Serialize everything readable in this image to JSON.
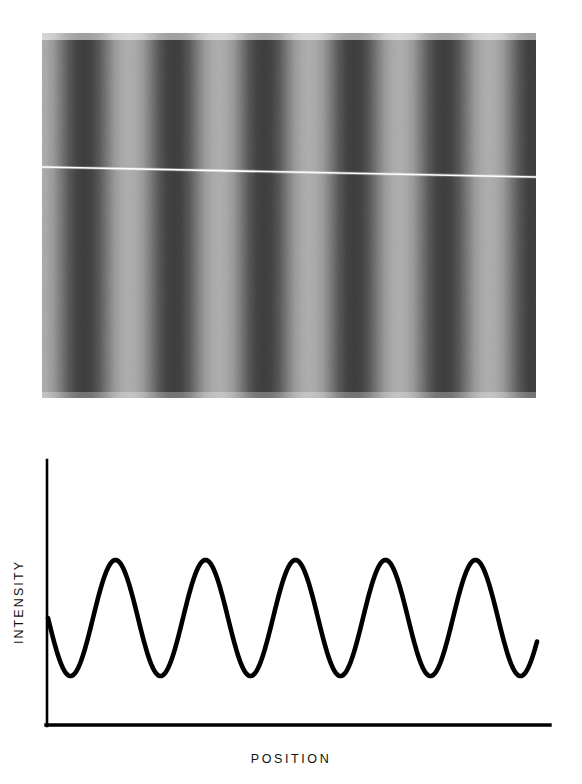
{
  "figure": {
    "kind": "interference-fringe-figure",
    "background_color": "#ffffff",
    "ink_color": "#000000"
  },
  "fringe_photograph": {
    "name": "interference-fringe-photograph",
    "description": "Grayscale photograph of vertical sinusoidal interference fringes",
    "bounds": {
      "x": 42,
      "y": 33,
      "width": 494,
      "height": 365
    },
    "fringe_period_px": 90,
    "fringe_count": 5.5,
    "first_dark_band_center_px": 90,
    "orientation": "vertical-bands",
    "bright_color": "#d9d9d9",
    "dark_color": "#090909",
    "grain_opacity": 0.2,
    "scratch": {
      "name": "horizontal-scratch-line",
      "color": "#ffffff",
      "y_left": 167,
      "y_right": 177,
      "thickness": 1.6
    }
  },
  "chart_data": {
    "type": "line",
    "title": "",
    "subtitle": "",
    "xlabel": "POSITION",
    "ylabel": "INTENSITY",
    "x_tick_labels": [],
    "y_tick_labels": [],
    "grid": false,
    "legend": null,
    "annotations": [],
    "series": [
      {
        "name": "intensity-profile",
        "waveform": "sinusoid",
        "color": "#000000",
        "stroke_width": 4.6,
        "cycles": 5.5,
        "period_px": 90,
        "amplitude_px": 58,
        "midline_px": 618,
        "peak_y_px": 560,
        "trough_y_px": 677,
        "start_x_px": 48,
        "end_x_px": 537,
        "start_phase": "midline-descending",
        "peak_x_positions_px": [
          117,
          208,
          300,
          387,
          478
        ],
        "trough_x_positions_px": [
          72,
          163,
          253,
          343,
          433,
          523
        ],
        "values_normalized": [
          0.5,
          0.29,
          0.11,
          0.01,
          0.0,
          0.08,
          0.25,
          0.47,
          0.7,
          0.88,
          0.98,
          1.0,
          0.93,
          0.78,
          0.58,
          0.36,
          0.17,
          0.04,
          0.0,
          0.05,
          0.2,
          0.4,
          0.63,
          0.83,
          0.96,
          1.0,
          0.95,
          0.82,
          0.62,
          0.41,
          0.21,
          0.06,
          0.0,
          0.03,
          0.16,
          0.35,
          0.57,
          0.78,
          0.93,
          1.0,
          0.97,
          0.85,
          0.66,
          0.45,
          0.25,
          0.09,
          0.01,
          0.01,
          0.11,
          0.28,
          0.5,
          0.72,
          0.9,
          0.99,
          0.99,
          0.89,
          0.72,
          0.51,
          0.3,
          0.13,
          0.02,
          0.0,
          0.07,
          0.22,
          0.44,
          0.66,
          0.85,
          0.97,
          1.0,
          0.92,
          0.77,
          0.56,
          0.34,
          0.15,
          0.03,
          0.0,
          0.09,
          0.26,
          0.48,
          0.5
        ]
      }
    ],
    "axes": {
      "y_axis": {
        "x": 47,
        "y_top": 460,
        "y_bottom": 726,
        "stroke_width": 2.6
      },
      "x_axis": {
        "y": 725,
        "x_left": 47,
        "x_right": 550,
        "stroke_width": 3.4
      }
    }
  },
  "labels": {
    "y_axis": "INTENSITY",
    "x_axis": "POSITION"
  }
}
